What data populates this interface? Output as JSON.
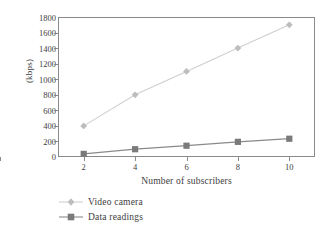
{
  "chart_data": {
    "type": "line",
    "title": "",
    "xlabel": "Number of subscribers",
    "ylabel": "(kbps)",
    "x": [
      2,
      4,
      6,
      8,
      10
    ],
    "xticklabels": [
      "2",
      "4",
      "6",
      "8",
      "10"
    ],
    "yticklabels": [
      "0",
      "200",
      "400",
      "600",
      "800",
      "1000",
      "1200",
      "1400",
      "1600",
      "1800"
    ],
    "yticks": [
      0,
      200,
      400,
      600,
      800,
      1000,
      1200,
      1400,
      1600,
      1800
    ],
    "xlim": [
      1,
      11
    ],
    "ylim": [
      0,
      1800
    ],
    "grid": false,
    "legend_position": "below-left",
    "series": [
      {
        "name": "Video camera",
        "values": [
          400,
          800,
          1100,
          1400,
          1700
        ],
        "marker": "diamond",
        "color": "#bdbdbd",
        "line_color": "#cfcfcf"
      },
      {
        "name": "Data readings",
        "values": [
          40,
          100,
          145,
          195,
          235
        ],
        "marker": "square",
        "color": "#7a7a7a",
        "line_color": "#8a8a8a"
      }
    ]
  },
  "axes": {
    "frame_color": "#8a8a8a",
    "tick_color": "#8a8a8a",
    "text_color": "#3d3d3d"
  }
}
